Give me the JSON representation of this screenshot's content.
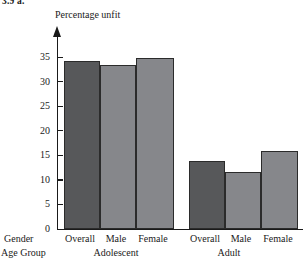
{
  "exercise_label": "3.9  a.",
  "chart_data": {
    "type": "bar",
    "title": "",
    "ylabel": "Percentage unfit",
    "xlabel": "",
    "ylim": [
      0,
      37
    ],
    "yticks": [
      0,
      5,
      10,
      15,
      20,
      25,
      30,
      35
    ],
    "grid": false,
    "legend": "none",
    "axis_row_labels": {
      "gender": "Gender",
      "age_group": "Age Group"
    },
    "categories": [
      "Overall",
      "Male",
      "Female",
      "Overall",
      "Male",
      "Female"
    ],
    "groups": [
      {
        "name": "Adolescent",
        "categories": [
          "Overall",
          "Male",
          "Female"
        ],
        "values": [
          34.2,
          33.4,
          34.8
        ]
      },
      {
        "name": "Adult",
        "categories": [
          "Overall",
          "Male",
          "Female"
        ],
        "values": [
          13.8,
          11.6,
          15.9
        ]
      }
    ],
    "values": [
      34.2,
      33.4,
      34.8,
      13.8,
      11.6,
      15.9
    ],
    "colors": {
      "overall_bar": "#57585a",
      "gender_bar": "#86878b",
      "bar_outline": "#2b2b2b",
      "axis": "#1a1a1a"
    }
  },
  "bars": [
    {
      "name": "adolescent-overall",
      "label": "Overall",
      "value": 34.2,
      "color": "#57585a",
      "left": 6,
      "width": 36
    },
    {
      "name": "adolescent-male",
      "label": "Male",
      "value": 33.4,
      "color": "#86878b",
      "left": 42,
      "width": 36
    },
    {
      "name": "adolescent-female",
      "label": "Female",
      "value": 34.8,
      "color": "#86878b",
      "left": 78,
      "width": 38
    },
    {
      "name": "adult-overall",
      "label": "Overall",
      "value": 13.8,
      "color": "#57585a",
      "left": 131,
      "width": 36
    },
    {
      "name": "adult-male",
      "label": "Male",
      "value": 11.6,
      "color": "#86878b",
      "left": 167,
      "width": 36
    },
    {
      "name": "adult-female",
      "label": "Female",
      "value": 15.9,
      "color": "#86878b",
      "left": 203,
      "width": 37
    }
  ],
  "gender_labels": [
    {
      "text": "Overall",
      "left": 60,
      "width": 40
    },
    {
      "text": "Male",
      "left": 98,
      "width": 36
    },
    {
      "text": "Female",
      "left": 132,
      "width": 42
    },
    {
      "text": "Overall",
      "left": 185,
      "width": 40
    },
    {
      "text": "Male",
      "left": 223,
      "width": 36
    },
    {
      "text": "Female",
      "left": 257,
      "width": 42
    }
  ],
  "group_labels": [
    {
      "text": "Adolescent",
      "left": 86,
      "width": 60
    },
    {
      "text": "Adult",
      "left": 208,
      "width": 42
    }
  ]
}
